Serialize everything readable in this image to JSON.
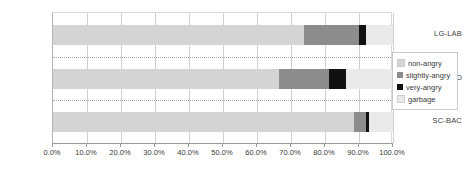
{
  "chart_data": {
    "type": "bar",
    "orientation": "horizontal",
    "stacked": true,
    "stack_mode": "percent",
    "title": "",
    "subtitle": "",
    "xlabel": "",
    "ylabel": "",
    "categories": [
      "LG-LAB",
      "LG-FIELD",
      "SC-BAC"
    ],
    "series": [
      {
        "name": "non-angry",
        "color": "#d4d4d4",
        "values": [
          73.8,
          66.5,
          88.5
        ]
      },
      {
        "name": "slightly-angry",
        "color": "#8c8c8c",
        "values": [
          16.2,
          14.7,
          3.5
        ]
      },
      {
        "name": "very-angry",
        "color": "#111111",
        "values": [
          2.0,
          5.0,
          1.0
        ]
      },
      {
        "name": "garbage",
        "color": "#eaeaea",
        "values": [
          8.0,
          13.8,
          7.0
        ]
      }
    ],
    "xlim": [
      0,
      100
    ],
    "xticks": [
      0,
      10,
      20,
      30,
      40,
      50,
      60,
      70,
      80,
      90,
      100
    ],
    "xtick_labels": [
      "0.0%",
      "10.0%",
      "20.0%",
      "30.0%",
      "40.0%",
      "50.0%",
      "60.0%",
      "70.0%",
      "80.0%",
      "90.0%",
      "100.0%"
    ],
    "grid": {
      "vertical": true,
      "horizontal": true
    },
    "legend": {
      "position": "right",
      "entries": [
        {
          "label": "non-angry",
          "color": "#d4d4d4"
        },
        {
          "label": "slightly-angry",
          "color": "#8c8c8c"
        },
        {
          "label": "very-angry",
          "color": "#111111"
        },
        {
          "label": "garbage",
          "color": "#eaeaea"
        }
      ]
    }
  }
}
